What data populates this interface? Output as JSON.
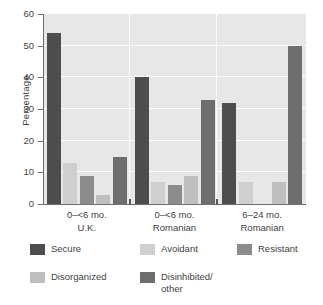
{
  "chart_data": {
    "type": "bar",
    "title": "",
    "xlabel": "",
    "ylabel": "Percentage",
    "ylim": [
      0,
      60
    ],
    "yticks": [
      0,
      10,
      20,
      30,
      40,
      50,
      60
    ],
    "ytick_labels": [
      "0",
      "10",
      "20",
      "30",
      "40",
      "50",
      "60"
    ],
    "grid": "horizontal-white-gridlines",
    "legend_position": "below-plot",
    "categories": [
      "0–<6 mo.\nU.K.",
      "0–<6 mo.\nRomanian",
      "6–24 mo.\nRomanian"
    ],
    "category_lines": [
      [
        "0–<6 mo.",
        "U.K."
      ],
      [
        "0–<6 mo.",
        "Romanian"
      ],
      [
        "6–24 mo.",
        "Romanian"
      ]
    ],
    "series": [
      {
        "name": "Secure",
        "color": "#4d4d4d",
        "values": [
          54,
          40,
          32
        ]
      },
      {
        "name": "Avoidant",
        "color": "#cfcfcf",
        "values": [
          13,
          7,
          7
        ]
      },
      {
        "name": "Resistant",
        "color": "#8c8c8c",
        "values": [
          9,
          6,
          0
        ]
      },
      {
        "name": "Disorganized",
        "color": "#bfbfbf",
        "values": [
          3,
          9,
          7
        ]
      },
      {
        "name": "Disinhibited/\nother",
        "color": "#6e6e6e",
        "values": [
          15,
          33,
          50
        ]
      }
    ]
  },
  "legend": {
    "items": [
      {
        "label": "Secure",
        "color": "#4d4d4d"
      },
      {
        "label": "Avoidant",
        "color": "#cfcfcf"
      },
      {
        "label": "Resistant",
        "color": "#8c8c8c"
      },
      {
        "label": "Disorganized",
        "color": "#bfbfbf"
      },
      {
        "label": "Disinhibited/\nother",
        "color": "#6e6e6e"
      }
    ]
  },
  "colors": {
    "plot_background": "#e7e7e7",
    "gridline": "#fbfbfb",
    "axis": "#6d6d6d",
    "text": "#3f3f3f",
    "page_background": "#ffffff"
  }
}
